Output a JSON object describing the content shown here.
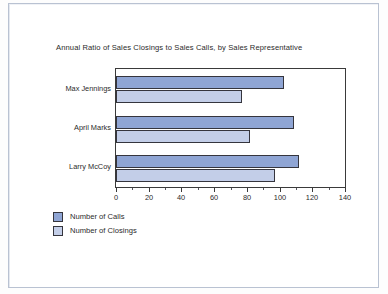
{
  "chart_data": {
    "type": "bar",
    "orientation": "horizontal",
    "title": "Annual Ratio of Sales Closings to Sales Calls, by Sales Representative",
    "xlabel": "",
    "ylabel": "",
    "categories": [
      "Max Jennings",
      "April Marks",
      "Larry McCoy"
    ],
    "series": [
      {
        "name": "Number of Calls",
        "color": "#8fa5d4",
        "values": [
          103,
          109,
          112
        ]
      },
      {
        "name": "Number of Closings",
        "color": "#c3cee8",
        "values": [
          77,
          82,
          97
        ]
      }
    ],
    "xlim": [
      0,
      140
    ],
    "xticks": [
      0,
      20,
      40,
      60,
      80,
      100,
      120,
      140
    ],
    "xtick_labels": [
      "0",
      "20",
      "40",
      "60",
      "80",
      "100",
      "120",
      "140"
    ],
    "minor_tick_step": 10,
    "grid": false,
    "legend_position": "below-left",
    "plot_border_color": "#3a3a3a",
    "bar_border_color": "#35353d",
    "background": "#ffffff"
  }
}
